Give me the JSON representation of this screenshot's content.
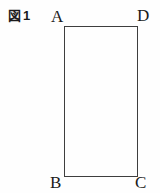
{
  "figure": {
    "label": "図1",
    "shape": "rectangle",
    "vertices": {
      "top_left": "A",
      "top_right": "D",
      "bottom_left": "B",
      "bottom_right": "C"
    },
    "colors": {
      "background": "#fefefe",
      "line": "#3e3e3e",
      "text": "#1b1b1b"
    }
  }
}
